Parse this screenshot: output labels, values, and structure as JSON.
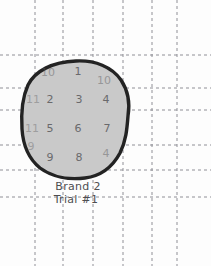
{
  "diagram": {
    "title_line1": "Brand 2",
    "title_line2": "Trial #1",
    "background_color": "#fdfdfd",
    "grid_color": "#8f8f96",
    "blob_fill_color": "#c9c9c9",
    "blob_outline_color": "#232323",
    "number_color": "#59595c"
  },
  "grid": {
    "vertical_lines": [
      35,
      63,
      93,
      123,
      152,
      177
    ],
    "horizontal_lines": [
      55,
      88,
      110,
      145,
      170,
      197
    ],
    "style": "dashed"
  },
  "counted_squares": {
    "description": "Hand-numbered grid squares used to count area covered by the blob",
    "total_labeled": 11,
    "rows": [
      {
        "row": 1,
        "cells": [
          {
            "label": "10",
            "x": 48,
            "y": 72,
            "partial": true
          },
          {
            "label": "1",
            "x": 78,
            "y": 71,
            "partial": false
          },
          {
            "label": "10",
            "x": 104,
            "y": 80,
            "partial": true
          }
        ]
      },
      {
        "row": 2,
        "cells": [
          {
            "label": "11",
            "x": 33,
            "y": 99,
            "partial": true
          },
          {
            "label": "2",
            "x": 50,
            "y": 99,
            "partial": false
          },
          {
            "label": "3",
            "x": 79,
            "y": 99,
            "partial": false
          },
          {
            "label": "4",
            "x": 106,
            "y": 99,
            "partial": false
          }
        ]
      },
      {
        "row": 3,
        "cells": [
          {
            "label": "11",
            "x": 32,
            "y": 128,
            "partial": true
          },
          {
            "label": "5",
            "x": 50,
            "y": 128,
            "partial": false
          },
          {
            "label": "6",
            "x": 78,
            "y": 128,
            "partial": false
          },
          {
            "label": "7",
            "x": 107,
            "y": 128,
            "partial": false
          }
        ]
      },
      {
        "row": 4,
        "cells": [
          {
            "label": "9",
            "x": 31,
            "y": 146,
            "partial": true
          },
          {
            "label": "9",
            "x": 50,
            "y": 157,
            "partial": false
          },
          {
            "label": "8",
            "x": 79,
            "y": 157,
            "partial": false
          },
          {
            "label": "4",
            "x": 106,
            "y": 153,
            "partial": true
          }
        ]
      }
    ]
  },
  "blob": {
    "name": "stain-outline",
    "shape": "irregular-rounded-blob",
    "bounds": {
      "left": 22,
      "top": 61,
      "right": 129,
      "bottom": 179
    }
  }
}
